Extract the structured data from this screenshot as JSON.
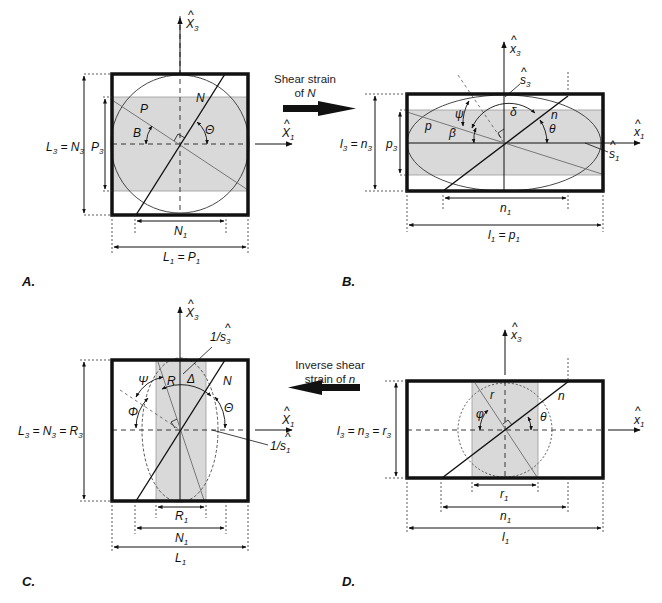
{
  "figure": {
    "panels": [
      {
        "id": "A",
        "label": "A.",
        "axis_x": "X̂1",
        "axis_z": "X̂3",
        "dims": {
          "vertical_outer": "L3 = N3",
          "vertical_inner": "P3",
          "horizontal_inner": "N1",
          "horizontal_outer": "L1 = P1"
        },
        "lines": {
          "plane": "P",
          "normal": "N"
        },
        "angles": [
          "B",
          "Θ"
        ]
      },
      {
        "id": "B",
        "label": "B.",
        "axis_x": "x̂1",
        "axis_z": "x̂3",
        "dims": {
          "vertical_outer": "l3 = n3",
          "vertical_inner": "p3",
          "horizontal_inner": "n1",
          "horizontal_outer": "l1 = p1"
        },
        "lines": {
          "plane": "p",
          "normal": "n"
        },
        "angles": [
          "ψ",
          "β",
          "δ",
          "θ"
        ],
        "stretch": [
          "ŝ3",
          "ŝ1"
        ]
      },
      {
        "id": "C",
        "label": "C.",
        "axis_x": "X̂1",
        "axis_z": "X̂3",
        "dims": {
          "vertical_outer": "L3 = N3 = R3",
          "horizontal_inner": "R1",
          "horizontal_mid": "N1",
          "horizontal_outer": "L1"
        },
        "lines": {
          "plane": "R",
          "normal": "N"
        },
        "angles": [
          "Ψ",
          "Φ",
          "Δ",
          "Θ"
        ],
        "stretch": [
          "1/ŝ3",
          "1/ŝ1"
        ]
      },
      {
        "id": "D",
        "label": "D.",
        "axis_x": "x̂1",
        "axis_z": "x̂3",
        "dims": {
          "vertical_outer": "l3 = n3 = r3",
          "horizontal_inner": "r1",
          "horizontal_mid": "n1",
          "horizontal_outer": "l1"
        },
        "lines": {
          "plane": "r",
          "normal": "n"
        },
        "angles": [
          "φ",
          "θ"
        ]
      }
    ],
    "transitions": [
      {
        "from": "A",
        "to": "B",
        "caption_line1": "Shear strain",
        "caption_line2": "of",
        "caption_var": "N",
        "direction": "right"
      },
      {
        "from": "D",
        "to": "C",
        "caption_line1": "Inverse shear",
        "caption_line2": "strain of",
        "caption_var": "n",
        "direction": "left"
      }
    ]
  },
  "text": {
    "A": {
      "panel": "A.",
      "x1": "X",
      "x1s": "1",
      "x3": "X",
      "x3s": "3",
      "P": "P",
      "N": "N",
      "B": "B",
      "Th": "Θ",
      "L3": "L",
      "L3s": "3",
      "eq1": " = N",
      "N3s": "3",
      "P3": "P",
      "P3s": "3",
      "N1": "N",
      "N1s": "1",
      "L1": "L",
      "L1s": "1",
      "eq2": " = P",
      "P1s": "1"
    },
    "B": {
      "panel": "B.",
      "x1": "x",
      "x1s": "1",
      "x3": "x",
      "x3s": "3",
      "s3": "s",
      "s3s": "3",
      "s1": "s",
      "s1s": "1",
      "p": "p",
      "n": "n",
      "psi": "ψ",
      "beta": "β",
      "delta": "δ",
      "theta": "θ",
      "l3": "l",
      "l3s": "3",
      "eq1": " = n",
      "n3s": "3",
      "p3": "p",
      "p3s": "3",
      "n1": "n",
      "n1s": "1",
      "l1": "l",
      "l1s": "1",
      "eq2": " = p",
      "p1s": "1"
    },
    "C": {
      "panel": "C.",
      "x1": "X",
      "x1s": "1",
      "x3": "X",
      "x3s": "3",
      "s3": "1/s",
      "s3s": "3",
      "s1": "1/s",
      "s1s": "1",
      "R": "R",
      "N": "N",
      "Psi": "Ψ",
      "Phi": "Φ",
      "Delta": "Δ",
      "Th": "Θ",
      "L3": "L",
      "L3s": "3",
      "eq1": " = N",
      "N3s": "3",
      "eq2": " = R",
      "R3s": "3",
      "R1": "R",
      "R1s": "1",
      "N1": "N",
      "N1s": "1",
      "L1": "L",
      "L1s": "1"
    },
    "D": {
      "panel": "D.",
      "x1": "x",
      "x1s": "1",
      "x3": "x",
      "x3s": "3",
      "r": "r",
      "n": "n",
      "phi": "φ",
      "theta": "θ",
      "l3": "l",
      "l3s": "3",
      "eq1": " = n",
      "n3s": "3",
      "eq2": " = r",
      "r3s": "3",
      "r1": "r",
      "r1s": "1",
      "n1": "n",
      "n1s": "1",
      "l1": "l",
      "l1s": "1"
    },
    "T1": {
      "l1": "Shear strain",
      "l2": "of ",
      "v": "N"
    },
    "T2": {
      "l1": "Inverse shear",
      "l2": "strain of ",
      "v": "n"
    }
  },
  "colors": {
    "frame": "#111111",
    "shade": "#d9d9d9",
    "thin": "#555555"
  }
}
